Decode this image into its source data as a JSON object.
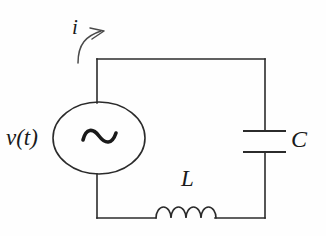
{
  "figure": {
    "kind": "electrical-circuit-diagram",
    "background_color": "#fefefe",
    "line_color": "#2b2b2b",
    "text_color": "#1a1a1a",
    "line_width": 1.6
  },
  "labels": {
    "source": "v(t)",
    "capacitor": "C",
    "inductor": "L",
    "current": "i"
  },
  "components": {
    "voltage_source": {
      "name": "ac-voltage-source",
      "symbol": "~",
      "shape": "ellipse",
      "center_x": 99,
      "center_y": 138,
      "radius_x": 46,
      "radius_y": 36
    },
    "capacitor": {
      "name": "capacitor",
      "symbol": "C",
      "plate_left_x": 243,
      "plate_right_x": 286,
      "plate_top_y": 131,
      "plate_bottom_y": 152
    },
    "inductor": {
      "name": "inductor",
      "symbol": "L",
      "coil_count": 4,
      "coil_start_x": 155,
      "coil_end_x": 215,
      "baseline_y": 218,
      "coil_height": 22
    },
    "current_arrow": {
      "name": "current-direction-arrow",
      "symbol": "i",
      "direction": "clockwise-from-source-top"
    }
  },
  "wires": {
    "top_y": 59,
    "bottom_y": 218,
    "left_x": 97,
    "right_x": 265
  }
}
